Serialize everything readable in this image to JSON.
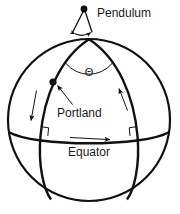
{
  "figure": {
    "background_color": "#ffffff",
    "stroke_color": "#111111",
    "width": 180,
    "height": 214
  },
  "labels": {
    "pendulum": "Pendulum",
    "portland": "Portland",
    "equator": "Equator",
    "theta": "Θ"
  },
  "icons": {
    "pivot": "pendulum-pivot-dot",
    "city": "portland-location-dot",
    "theta": "theta-angle-symbol",
    "right_angle_left": "right-angle-marker",
    "right_angle_right": "right-angle-marker"
  },
  "geometry": {
    "sphere_center_x": 89,
    "sphere_center_y": 120,
    "sphere_radius": 81,
    "north_pole_x": 89,
    "north_pole_y": 40,
    "equator_y": 136,
    "portland_x": 53,
    "portland_y": 82,
    "pendulum_pivot_x": 84,
    "pendulum_pivot_y": 8
  }
}
